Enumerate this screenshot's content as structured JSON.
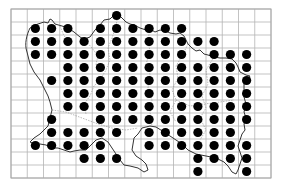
{
  "map": {
    "type": "grid distribution map",
    "grid": {
      "left": 11,
      "top": 9,
      "right": 271,
      "bottom": 178,
      "columns": 16,
      "rows": 13,
      "line_color": "#b4b4b4"
    },
    "dot_color": "#000000",
    "dot_radius": 4.6,
    "occupied_cells": [
      {
        "row": 0,
        "cols": [
          6
        ]
      },
      {
        "row": 1,
        "cols": [
          1,
          2,
          3,
          5,
          6,
          7,
          8,
          9,
          10
        ]
      },
      {
        "row": 2,
        "cols": [
          1,
          2,
          3,
          4,
          5,
          6,
          7,
          8,
          9,
          10,
          11,
          12
        ]
      },
      {
        "row": 3,
        "cols": [
          1,
          2,
          3,
          4,
          5,
          6,
          7,
          8,
          9,
          10,
          12,
          13,
          14
        ]
      },
      {
        "row": 4,
        "cols": [
          3,
          4,
          5,
          6,
          7,
          8,
          9,
          10,
          11,
          12,
          13,
          14
        ]
      },
      {
        "row": 5,
        "cols": [
          2,
          3,
          4,
          5,
          6,
          7,
          8,
          9,
          10,
          11,
          12,
          13,
          14
        ]
      },
      {
        "row": 6,
        "cols": [
          3,
          4,
          5,
          6,
          7,
          8,
          9,
          10,
          11,
          12,
          13,
          14
        ]
      },
      {
        "row": 7,
        "cols": [
          3,
          4,
          5,
          6,
          7,
          8,
          9,
          10,
          11,
          12,
          13,
          14
        ]
      },
      {
        "row": 8,
        "cols": [
          2,
          5,
          6,
          7,
          8,
          9,
          10,
          11,
          12,
          13,
          14
        ]
      },
      {
        "row": 9,
        "cols": [
          2,
          3,
          4,
          5,
          6,
          8,
          9,
          10,
          11,
          12,
          13
        ]
      },
      {
        "row": 10,
        "cols": [
          1,
          2,
          3,
          4,
          5,
          8,
          9,
          10,
          11,
          12,
          13,
          14
        ]
      },
      {
        "row": 11,
        "cols": [
          4,
          5,
          6,
          11,
          12,
          13,
          14
        ]
      },
      {
        "row": 12,
        "cols": [
          11,
          14
        ]
      }
    ],
    "total_records": 139
  }
}
